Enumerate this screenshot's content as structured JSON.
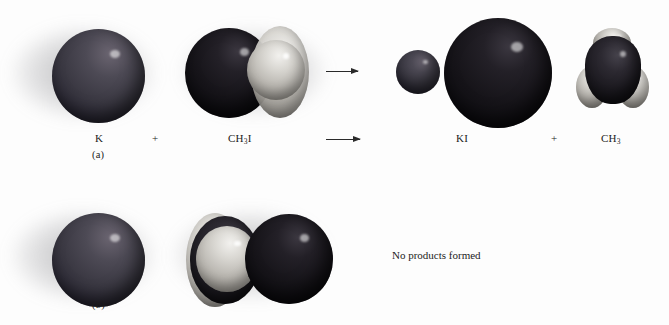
{
  "figure": {
    "background_color": "#fdfdfd",
    "text_color": "#1c1c1c"
  },
  "panels": [
    {
      "tag": "(a)",
      "outcome_type": "reaction",
      "reactants": [
        {
          "label_html": "K",
          "name": "potassium-atom"
        },
        {
          "label_html": "CH<sub>3</sub>I",
          "name": "methyl-iodide-molecule"
        }
      ],
      "operator": "+",
      "arrow": "⟶",
      "products": [
        {
          "label_html": "KI",
          "name": "potassium-iodide-molecule"
        },
        {
          "label_html": "CH<sub>3</sub>",
          "name": "methyl-radical"
        }
      ],
      "equation_text": "K + CH3I ⟶ KI + CH3"
    },
    {
      "tag": "(b)",
      "outcome_type": "no-reaction",
      "reactants": [
        {
          "label_html": "K",
          "name": "potassium-atom"
        },
        {
          "label_html": "CH<sub>3</sub>I",
          "name": "methyl-iodide-molecule-flipped"
        }
      ],
      "outcome_text": "No products formed"
    }
  ],
  "atom_colors": {
    "potassium": "#4d4a55",
    "iodine": "#161419",
    "carbon": "#1c1a20",
    "hydrogen": "#d9d7d2"
  },
  "labels": {
    "panel_a_tag": "(a)",
    "panel_b_tag": "(b)",
    "reactant_k": "K",
    "plus_sign_1": "+",
    "reactant_ch3i_prefix": "CH",
    "reactant_ch3i_sub": "3",
    "reactant_ch3i_suffix": "I",
    "product_ki": "KI",
    "plus_sign_2": "+",
    "product_ch3_prefix": "CH",
    "product_ch3_sub": "3",
    "no_products_text": "No products formed"
  }
}
